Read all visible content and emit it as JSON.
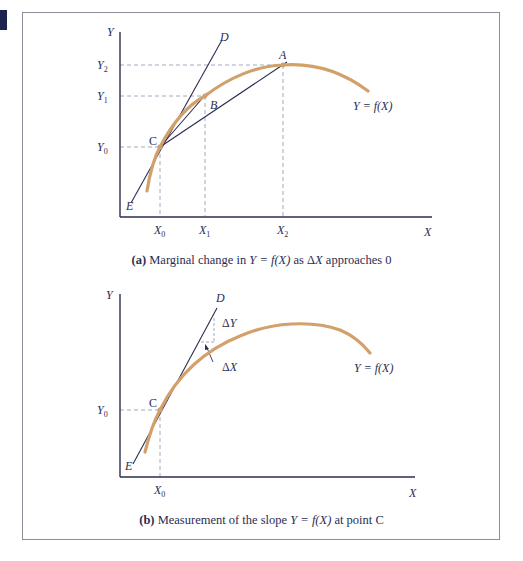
{
  "colors": {
    "curve": "#d2a06a",
    "lines": "#2a2d52",
    "guides": "#9aa0b8",
    "frame": "#8c8f98",
    "corner_block": "#1c2350"
  },
  "panel_a": {
    "axis_y_label": "Y",
    "axis_x_label": "X",
    "y_ticks": [
      "Y2",
      "Y1",
      "Y0"
    ],
    "x_ticks": [
      "X0",
      "X1",
      "X2"
    ],
    "points": [
      "A",
      "B",
      "C",
      "D",
      "E"
    ],
    "curve_label": "Y = f(X)",
    "caption_prefix": "(a)",
    "caption_text_1": " Marginal change in ",
    "caption_math": "Y = f(X)",
    "caption_text_2": " as Δ",
    "caption_math_2": "X",
    "caption_text_3": " approaches 0"
  },
  "panel_b": {
    "axis_y_label": "Y",
    "axis_x_label": "X",
    "y_ticks": [
      "Y0"
    ],
    "x_ticks": [
      "X0"
    ],
    "points": [
      "C",
      "D",
      "E"
    ],
    "delta_y_label": "ΔY",
    "delta_x_label": "ΔX",
    "curve_label": "Y = f(X)",
    "caption_prefix": "(b)",
    "caption_text_1": " Measurement of the slope ",
    "caption_math": "Y = f(X)",
    "caption_text_2": " at point C"
  }
}
